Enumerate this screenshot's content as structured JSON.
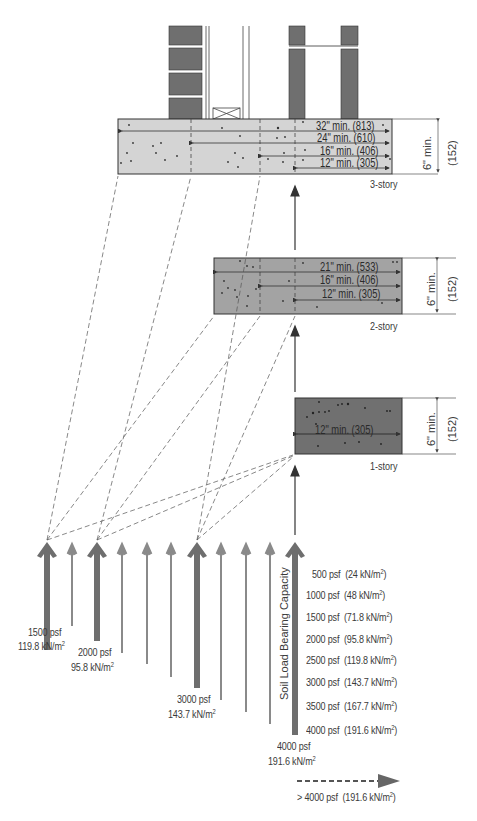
{
  "footings": [
    {
      "id": "3-story",
      "label": "3-story",
      "fill": "#d4d4d4",
      "depth_label": "6\" min.",
      "depth_metric": "(152)",
      "widths": [
        "32\" min. (813)",
        "24\" min. (610)",
        "16\" min. (406)",
        "12\" min. (305)"
      ]
    },
    {
      "id": "2-story",
      "label": "2-story",
      "fill": "#a3a3a3",
      "depth_label": "6\" min.",
      "depth_metric": "(152)",
      "widths": [
        "21\" min. (533)",
        "16\" min. (406)",
        "12\" min. (305)"
      ]
    },
    {
      "id": "1-story",
      "label": "1-story",
      "fill": "#707070",
      "depth_label": "6\" min.",
      "depth_metric": "(152)",
      "widths": [
        "12\" min. (305)"
      ]
    }
  ],
  "axis_label": "Soil Load Bearing Capacity",
  "highlighted_arrows": [
    {
      "psf": "1500 psf",
      "metric": "119.8 kN/m",
      "sup": "2"
    },
    {
      "psf": "2000 psf",
      "metric": "95.8 kN/m",
      "sup": "2"
    },
    {
      "psf": "3000 psf",
      "metric": "143.7 kN/m",
      "sup": "2"
    },
    {
      "psf": "4000 psf",
      "metric": "191.6 kN/m",
      "sup": "2"
    }
  ],
  "legend": [
    {
      "psf": "500 psf",
      "metric": "(24 kN/m",
      "sup": "2",
      "close": ")"
    },
    {
      "psf": "1000 psf",
      "metric": "(48 kN/m",
      "sup": "2",
      "close": ")"
    },
    {
      "psf": "1500 psf",
      "metric": "(71.8 kN/m",
      "sup": "2",
      "close": ")"
    },
    {
      "psf": "2000 psf",
      "metric": "(95.8 kN/m",
      "sup": "2",
      "close": ")"
    },
    {
      "psf": "2500 psf",
      "metric": "(119.8 kN/m",
      "sup": "2",
      "close": ")"
    },
    {
      "psf": "3000 psf",
      "metric": "(143.7 kN/m",
      "sup": "2",
      "close": ")"
    },
    {
      "psf": "3500 psf",
      "metric": "(167.7 kN/m",
      "sup": "2",
      "close": ")"
    },
    {
      "psf": "4000 psf",
      "metric": "(191.6 kN/m",
      "sup": "2",
      "close": ")"
    }
  ],
  "dashed_legend": {
    "psf": "> 4000 psf",
    "metric": "(191.6 kN/m",
    "sup": "2",
    "close": ")"
  },
  "colors": {
    "arrow_thick": "#6e6e6e",
    "arrow_thin": "#8a8a8a",
    "masonry": "#6f6f6f",
    "line": "#333333"
  }
}
